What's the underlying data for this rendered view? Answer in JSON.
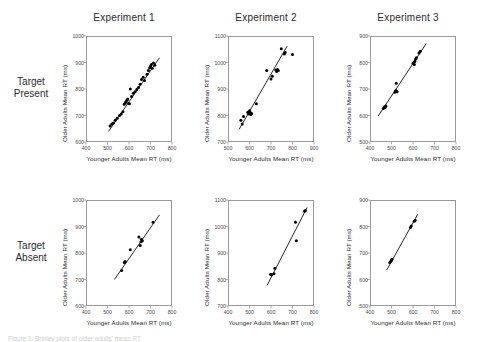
{
  "figure": {
    "column_titles": [
      "Experiment 1",
      "Experiment 2",
      "Experiment 3"
    ],
    "row_labels": [
      {
        "line1": "Target",
        "line2": "Present"
      },
      {
        "line1": "Target",
        "line2": "Absent"
      }
    ],
    "caption": "Figure 1. Brinley plots of older adults' mean RT"
  },
  "axis_titles": {
    "x": "Younger Adults Mean RT (ms)",
    "y": "Older Adults Mean RT (ms)"
  },
  "chart_data": [
    {
      "type": "scatter",
      "title": "Experiment 1",
      "row": "Target Present",
      "xlabel": "Younger Adults Mean RT (ms)",
      "ylabel": "Older Adults Mean RT (ms)",
      "xlim": [
        400,
        800
      ],
      "ylim": [
        600,
        1000
      ],
      "xticks": [
        400,
        500,
        600,
        700,
        800
      ],
      "yticks": [
        600,
        700,
        800,
        900,
        1000
      ],
      "grid": false,
      "legend": "none",
      "fit_line": {
        "x": [
          505,
          742
        ],
        "y": [
          640,
          918
        ]
      },
      "points": [
        {
          "x": 512,
          "y": 660
        },
        {
          "x": 520,
          "y": 668
        },
        {
          "x": 528,
          "y": 672
        },
        {
          "x": 536,
          "y": 682
        },
        {
          "x": 545,
          "y": 690
        },
        {
          "x": 556,
          "y": 700
        },
        {
          "x": 564,
          "y": 706
        },
        {
          "x": 572,
          "y": 714
        },
        {
          "x": 578,
          "y": 742
        },
        {
          "x": 583,
          "y": 748
        },
        {
          "x": 586,
          "y": 752
        },
        {
          "x": 590,
          "y": 758
        },
        {
          "x": 594,
          "y": 762
        },
        {
          "x": 598,
          "y": 745
        },
        {
          "x": 602,
          "y": 744
        },
        {
          "x": 606,
          "y": 800
        },
        {
          "x": 612,
          "y": 772
        },
        {
          "x": 620,
          "y": 784
        },
        {
          "x": 628,
          "y": 790
        },
        {
          "x": 636,
          "y": 798
        },
        {
          "x": 644,
          "y": 806
        },
        {
          "x": 652,
          "y": 818
        },
        {
          "x": 658,
          "y": 836
        },
        {
          "x": 666,
          "y": 844
        },
        {
          "x": 672,
          "y": 832
        },
        {
          "x": 684,
          "y": 856
        },
        {
          "x": 690,
          "y": 870
        },
        {
          "x": 696,
          "y": 880
        },
        {
          "x": 700,
          "y": 886
        },
        {
          "x": 704,
          "y": 892
        },
        {
          "x": 708,
          "y": 878
        },
        {
          "x": 714,
          "y": 898
        },
        {
          "x": 720,
          "y": 890
        }
      ]
    },
    {
      "type": "scatter",
      "title": "Experiment 2",
      "row": "Target Present",
      "xlabel": "Younger Adults Mean RT (ms)",
      "ylabel": "Older Adults Mean RT (ms)",
      "xlim": [
        500,
        900
      ],
      "ylim": [
        700,
        1100
      ],
      "xticks": [
        500,
        600,
        700,
        800,
        900
      ],
      "yticks": [
        700,
        800,
        900,
        1000,
        1100
      ],
      "grid": false,
      "legend": "none",
      "fit_line": {
        "x": [
          552,
          775
        ],
        "y": [
          748,
          1062
        ]
      },
      "points": [
        {
          "x": 560,
          "y": 782
        },
        {
          "x": 566,
          "y": 768
        },
        {
          "x": 572,
          "y": 796
        },
        {
          "x": 592,
          "y": 812
        },
        {
          "x": 596,
          "y": 806
        },
        {
          "x": 600,
          "y": 818
        },
        {
          "x": 603,
          "y": 812
        },
        {
          "x": 606,
          "y": 804
        },
        {
          "x": 610,
          "y": 808
        },
        {
          "x": 632,
          "y": 844
        },
        {
          "x": 680,
          "y": 970
        },
        {
          "x": 700,
          "y": 938
        },
        {
          "x": 706,
          "y": 948
        },
        {
          "x": 722,
          "y": 972
        },
        {
          "x": 726,
          "y": 966
        },
        {
          "x": 730,
          "y": 974
        },
        {
          "x": 734,
          "y": 970
        },
        {
          "x": 748,
          "y": 1052
        },
        {
          "x": 762,
          "y": 1032
        },
        {
          "x": 766,
          "y": 1038
        },
        {
          "x": 800,
          "y": 1030
        }
      ]
    },
    {
      "type": "scatter",
      "title": "Experiment 3",
      "row": "Target Present",
      "xlabel": "Younger Adults Mean RT (ms)",
      "ylabel": "Older Adults Mean RT (ms)",
      "xlim": [
        400,
        800
      ],
      "ylim": [
        500,
        900
      ],
      "xticks": [
        400,
        500,
        600,
        700,
        800
      ],
      "yticks": [
        500,
        600,
        700,
        800,
        900
      ],
      "grid": false,
      "legend": "none",
      "fit_line": {
        "x": [
          438,
          662
        ],
        "y": [
          598,
          872
        ]
      },
      "points": [
        {
          "x": 462,
          "y": 626
        },
        {
          "x": 466,
          "y": 632
        },
        {
          "x": 470,
          "y": 630
        },
        {
          "x": 474,
          "y": 636
        },
        {
          "x": 516,
          "y": 688
        },
        {
          "x": 520,
          "y": 694
        },
        {
          "x": 522,
          "y": 722
        },
        {
          "x": 526,
          "y": 690
        },
        {
          "x": 600,
          "y": 796
        },
        {
          "x": 604,
          "y": 800
        },
        {
          "x": 606,
          "y": 792
        },
        {
          "x": 608,
          "y": 804
        },
        {
          "x": 612,
          "y": 812
        },
        {
          "x": 616,
          "y": 818
        },
        {
          "x": 628,
          "y": 836
        },
        {
          "x": 634,
          "y": 842
        }
      ]
    },
    {
      "type": "scatter",
      "title": "Experiment 1",
      "row": "Target Absent",
      "xlabel": "Younger Adults Mean RT (ms)",
      "ylabel": "Older Adults Mean RT (ms)",
      "xlim": [
        400,
        800
      ],
      "ylim": [
        600,
        1000
      ],
      "xticks": [
        400,
        500,
        600,
        700,
        800
      ],
      "yticks": [
        600,
        700,
        800,
        900,
        1000
      ],
      "grid": false,
      "legend": "none",
      "fit_line": {
        "x": [
          532,
          742
        ],
        "y": [
          700,
          944
        ]
      },
      "points": [
        {
          "x": 566,
          "y": 734
        },
        {
          "x": 578,
          "y": 764
        },
        {
          "x": 582,
          "y": 768
        },
        {
          "x": 606,
          "y": 812
        },
        {
          "x": 646,
          "y": 860
        },
        {
          "x": 652,
          "y": 828
        },
        {
          "x": 656,
          "y": 842
        },
        {
          "x": 658,
          "y": 852
        },
        {
          "x": 662,
          "y": 846
        },
        {
          "x": 712,
          "y": 916
        }
      ]
    },
    {
      "type": "scatter",
      "title": "Experiment 2",
      "row": "Target Absent",
      "xlabel": "Younger Adults Mean RT (ms)",
      "ylabel": "Older Adults Mean RT (ms)",
      "xlim": [
        400,
        800
      ],
      "ylim": [
        700,
        1100
      ],
      "xticks": [
        400,
        500,
        600,
        700,
        800
      ],
      "yticks": [
        700,
        800,
        900,
        1000,
        1100
      ],
      "grid": false,
      "legend": "none",
      "fit_line": {
        "x": [
          582,
          768
        ],
        "y": [
          778,
          1072
        ]
      },
      "points": [
        {
          "x": 598,
          "y": 820
        },
        {
          "x": 604,
          "y": 818
        },
        {
          "x": 614,
          "y": 822
        },
        {
          "x": 618,
          "y": 842
        },
        {
          "x": 714,
          "y": 1016
        },
        {
          "x": 718,
          "y": 946
        },
        {
          "x": 756,
          "y": 1058
        },
        {
          "x": 760,
          "y": 1060
        }
      ]
    },
    {
      "type": "scatter",
      "title": "Experiment 3",
      "row": "Target Absent",
      "xlabel": "Younger Adults Mean RT (ms)",
      "ylabel": "Older Adults Mean RT (ms)",
      "xlim": [
        400,
        800
      ],
      "ylim": [
        500,
        900
      ],
      "xticks": [
        400,
        500,
        600,
        700,
        800
      ],
      "yticks": [
        500,
        600,
        700,
        800,
        900
      ],
      "grid": false,
      "legend": "none",
      "fit_line": {
        "x": [
          478,
          622
        ],
        "y": [
          636,
          846
        ]
      },
      "points": [
        {
          "x": 492,
          "y": 664
        },
        {
          "x": 496,
          "y": 668
        },
        {
          "x": 500,
          "y": 672
        },
        {
          "x": 502,
          "y": 676
        },
        {
          "x": 588,
          "y": 796
        },
        {
          "x": 592,
          "y": 802
        },
        {
          "x": 606,
          "y": 820
        },
        {
          "x": 610,
          "y": 824
        }
      ]
    }
  ]
}
